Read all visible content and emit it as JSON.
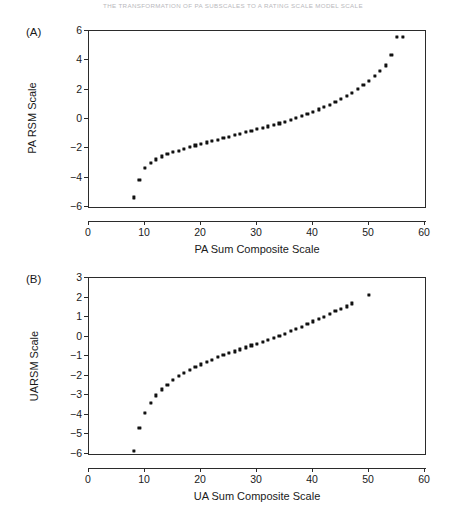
{
  "page": {
    "running_header": "THE TRANSFORMATION OF PA SUBSCALES TO A RATING SCALE MODEL SCALE"
  },
  "panels": [
    {
      "id": "panel-a",
      "tag": "(A)"
    },
    {
      "id": "panel-b",
      "tag": "(B)"
    }
  ],
  "chart_data": [
    {
      "type": "scatter",
      "panel": "(A)",
      "title": "",
      "xlabel": "PA Sum Composite Scale",
      "ylabel": "PA RSM Scale",
      "xlim": [
        0,
        60
      ],
      "ylim": [
        -6,
        6
      ],
      "xticks": [
        0,
        10,
        20,
        30,
        40,
        50,
        60
      ],
      "yticks": [
        6,
        4,
        2,
        0,
        -2,
        -4,
        -6
      ],
      "grid": false,
      "legend": "none",
      "marker": "filled-square",
      "marker_color": "#111111",
      "x": [
        8,
        9,
        10,
        11,
        12,
        13,
        14,
        15,
        16,
        17,
        18,
        19,
        20,
        21,
        22,
        23,
        24,
        25,
        26,
        27,
        28,
        29,
        30,
        31,
        32,
        33,
        34,
        35,
        36,
        37,
        38,
        39,
        40,
        41,
        42,
        43,
        44,
        45,
        46,
        47,
        48,
        49,
        50,
        51,
        52,
        53,
        54,
        55,
        56
      ],
      "y": [
        -5.35,
        -4.15,
        -3.35,
        -3.0,
        -2.75,
        -2.55,
        -2.4,
        -2.25,
        -2.15,
        -2.05,
        -1.92,
        -1.8,
        -1.7,
        -1.6,
        -1.5,
        -1.4,
        -1.3,
        -1.2,
        -1.1,
        -1.0,
        -0.9,
        -0.8,
        -0.7,
        -0.6,
        -0.5,
        -0.4,
        -0.3,
        -0.18,
        -0.05,
        0.08,
        0.2,
        0.35,
        0.5,
        0.65,
        0.8,
        0.95,
        1.15,
        1.35,
        1.55,
        1.8,
        2.05,
        2.3,
        2.6,
        2.95,
        3.3,
        3.65,
        4.35,
        5.6,
        5.6
      ]
    },
    {
      "type": "scatter",
      "panel": "(B)",
      "title": "",
      "xlabel": "UA Sum Composite Scale",
      "ylabel": "UARSM Scale",
      "xlim": [
        0,
        60
      ],
      "ylim": [
        -6,
        3
      ],
      "xticks": [
        0,
        10,
        20,
        30,
        40,
        50,
        60
      ],
      "yticks": [
        3,
        2,
        1,
        0,
        -1,
        -2,
        -3,
        -4,
        -5,
        -6
      ],
      "grid": false,
      "legend": "none",
      "marker": "filled-square",
      "marker_color": "#111111",
      "x": [
        8,
        9,
        10,
        11,
        12,
        13,
        14,
        15,
        16,
        17,
        18,
        19,
        20,
        21,
        22,
        23,
        24,
        25,
        26,
        27,
        28,
        29,
        30,
        31,
        32,
        33,
        34,
        35,
        36,
        37,
        38,
        39,
        40,
        41,
        42,
        43,
        44,
        45,
        46,
        47,
        50
      ],
      "y": [
        -5.85,
        -4.65,
        -3.9,
        -3.4,
        -3.0,
        -2.7,
        -2.45,
        -2.22,
        -2.0,
        -1.85,
        -1.7,
        -1.55,
        -1.42,
        -1.3,
        -1.18,
        -1.05,
        -0.95,
        -0.85,
        -0.75,
        -0.65,
        -0.55,
        -0.45,
        -0.35,
        -0.25,
        -0.15,
        -0.05,
        0.05,
        0.15,
        0.28,
        0.4,
        0.52,
        0.65,
        0.78,
        0.9,
        1.02,
        1.15,
        1.3,
        1.42,
        1.55,
        1.7,
        2.15
      ]
    }
  ]
}
